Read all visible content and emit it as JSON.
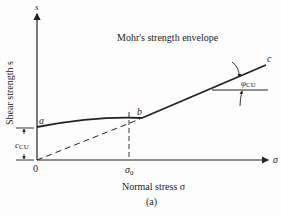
{
  "title": "Mohr's strength envelope",
  "axes": {
    "y_label": "Shear strength s",
    "y_symbol": "s",
    "x_label": "Normal stress σ",
    "x_symbol": "σ",
    "origin_label": "0"
  },
  "points": {
    "a": "a",
    "b": "b",
    "c": "c"
  },
  "annotations": {
    "sigma0": "σ",
    "sigma0_sub": "0",
    "cohesion": "c",
    "cohesion_sub": "CU",
    "friction_angle": "φ",
    "friction_angle_sub": "CU"
  },
  "caption": "(a)",
  "colors": {
    "ink": "#222222",
    "background": "#fdfdfd"
  }
}
